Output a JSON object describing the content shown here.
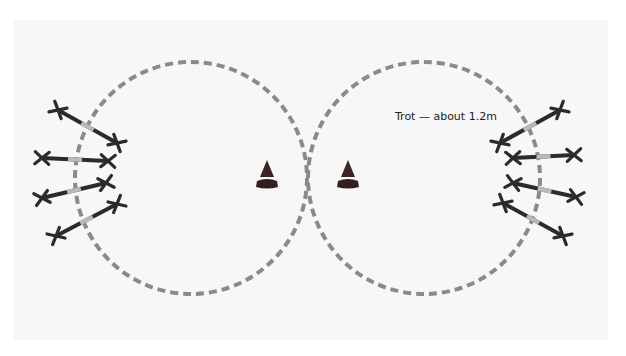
{
  "diagram": {
    "label": {
      "text": "Trot — about 1.2m",
      "x": 395,
      "y": 116
    },
    "colors": {
      "background": "#f7f7f7",
      "circle_dash": "#8a8a8a",
      "stride_bar": "#2b2b2b",
      "stride_mid": "#b9b9b9",
      "cone": "#3a2524",
      "cone_base": "#2f1f1e"
    },
    "circles": [
      {
        "id": "left-circle",
        "cx": 191,
        "cy": 178,
        "r": 116
      },
      {
        "id": "right-circle",
        "cx": 424,
        "cy": 178,
        "r": 116
      }
    ],
    "cones": [
      {
        "id": "cone-left",
        "x": 267,
        "y": 160
      },
      {
        "id": "cone-right",
        "x": 348,
        "y": 160
      }
    ],
    "strides": [
      {
        "side": "left",
        "x1": 58,
        "y1": 110,
        "x2": 117,
        "y2": 143
      },
      {
        "side": "left",
        "x1": 42,
        "y1": 158,
        "x2": 108,
        "y2": 161
      },
      {
        "side": "left",
        "x1": 42,
        "y1": 198,
        "x2": 106,
        "y2": 183
      },
      {
        "side": "left",
        "x1": 56,
        "y1": 236,
        "x2": 117,
        "y2": 204
      },
      {
        "side": "right",
        "x1": 560,
        "y1": 110,
        "x2": 500,
        "y2": 143
      },
      {
        "side": "right",
        "x1": 513,
        "y1": 158,
        "x2": 574,
        "y2": 155
      },
      {
        "side": "right",
        "x1": 513,
        "y1": 183,
        "x2": 576,
        "y2": 197
      },
      {
        "side": "right",
        "x1": 503,
        "y1": 203,
        "x2": 563,
        "y2": 236
      }
    ]
  }
}
